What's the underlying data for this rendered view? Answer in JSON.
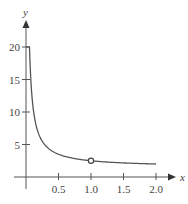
{
  "chart_data": {
    "type": "line",
    "title": "",
    "xlabel": "x",
    "ylabel": "y",
    "xlim": [
      0,
      2.0
    ],
    "ylim": [
      0,
      20
    ],
    "grid": false,
    "legend": null,
    "x_ticks": [
      "0.5",
      "1.0",
      "1.5",
      "2.0"
    ],
    "y_ticks": [
      "5",
      "10",
      "15",
      "20"
    ],
    "series": [
      {
        "name": "curve",
        "function": "y = 1.5 + 1/x",
        "x": [
          0.053,
          0.07,
          0.1,
          0.15,
          0.2,
          0.3,
          0.4,
          0.5,
          0.6,
          0.75,
          1.0,
          1.25,
          1.5,
          1.75,
          2.0
        ],
        "values": [
          20,
          15.8,
          11.5,
          8.17,
          6.5,
          4.83,
          4.0,
          3.5,
          3.17,
          2.83,
          2.5,
          2.3,
          2.17,
          2.07,
          2.0
        ]
      }
    ],
    "annotations": [
      {
        "type": "open-circle",
        "x": 1.0,
        "y": 2.5
      }
    ],
    "colors": {
      "curve": "#555555",
      "axis": "#555555",
      "text": "#444444"
    }
  },
  "axes": {
    "x_label": "x",
    "y_label": "y",
    "x_ticks": [
      "0.5",
      "1.0",
      "1.5",
      "2.0"
    ],
    "y_ticks": [
      "5",
      "10",
      "15",
      "20"
    ]
  }
}
